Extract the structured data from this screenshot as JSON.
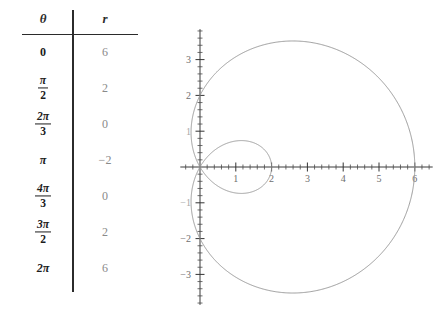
{
  "table": {
    "headers": {
      "theta": "θ",
      "r": "r"
    },
    "rows": [
      {
        "theta_display": "0",
        "theta_num": "",
        "theta_den": "",
        "theta_is_fraction": false,
        "r": "6"
      },
      {
        "theta_display": "",
        "theta_num": "π",
        "theta_den": "2",
        "theta_is_fraction": true,
        "r": "2"
      },
      {
        "theta_display": "",
        "theta_num": "2π",
        "theta_den": "3",
        "theta_is_fraction": true,
        "r": "0"
      },
      {
        "theta_display": "π",
        "theta_num": "",
        "theta_den": "",
        "theta_is_fraction": false,
        "r": "−2"
      },
      {
        "theta_display": "",
        "theta_num": "4π",
        "theta_den": "3",
        "theta_is_fraction": true,
        "r": "0"
      },
      {
        "theta_display": "",
        "theta_num": "3π",
        "theta_den": "2",
        "theta_is_fraction": true,
        "r": "2"
      },
      {
        "theta_display": "2π",
        "theta_num": "",
        "theta_den": "",
        "theta_is_fraction": false,
        "r": "6"
      }
    ]
  },
  "colors": {
    "curve": "#9a9a9a",
    "axis": "#3a3a3a",
    "table_rule": "#2b2b2b",
    "theta_text": "#1c1c1c",
    "r_text": "#8a8a8a",
    "tick_label": "#6e6e6e",
    "background": "#ffffff"
  },
  "chart_data": {
    "type": "line",
    "title": "",
    "subtitle": "",
    "xlabel": "",
    "ylabel": "",
    "curve_equation": "r = 2 + 4 cos(θ)",
    "curve_name": "limacon-with-inner-loop",
    "coordinate_system": "polar",
    "grid": false,
    "legend": false,
    "xlim": [
      -0.55,
      6.5
    ],
    "ylim": [
      -3.85,
      3.85
    ],
    "x_tick_labels": [
      "1",
      "2",
      "3",
      "4",
      "5",
      "6"
    ],
    "x_tick_values": [
      1,
      2,
      3,
      4,
      5,
      6
    ],
    "y_tick_labels": [
      "3",
      "2",
      "1",
      "−1",
      "−2",
      "−3"
    ],
    "y_tick_values": [
      3,
      2,
      1,
      -1,
      -2,
      -3
    ],
    "minor_tick_step": 0.2,
    "theta_samples": [
      0,
      1.5707963,
      2.0943951,
      3.1415927,
      4.1887902,
      4.712389,
      6.2831853
    ],
    "r_samples": [
      6,
      2,
      0,
      -2,
      0,
      2,
      6
    ],
    "key_points": [
      {
        "theta": "0",
        "r": 6,
        "x": 6,
        "y": 0
      },
      {
        "theta": "pi/2",
        "r": 2,
        "x": 0,
        "y": 2
      },
      {
        "theta": "2pi/3",
        "r": 0,
        "x": 0,
        "y": 0
      },
      {
        "theta": "pi",
        "r": -2,
        "x": 2,
        "y": 0
      },
      {
        "theta": "4pi/3",
        "r": 0,
        "x": 0,
        "y": 0
      },
      {
        "theta": "3pi/2",
        "r": 2,
        "x": 0,
        "y": -2
      },
      {
        "theta": "2pi",
        "r": 6,
        "x": 6,
        "y": 0
      }
    ],
    "outer_loop_max_y": 3.46,
    "outer_loop_min_y": -3.46,
    "inner_loop_x_extent": 2,
    "x_intercepts": [
      0,
      2,
      6
    ],
    "y_intercepts": [
      -2,
      2
    ]
  }
}
